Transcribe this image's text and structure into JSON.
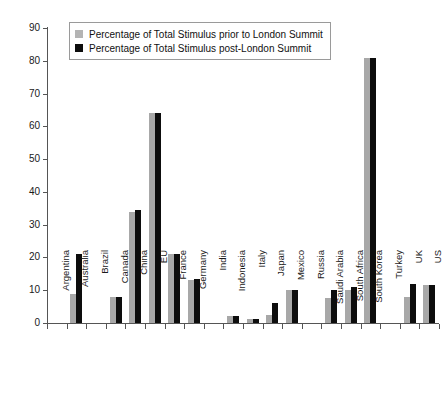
{
  "chart_data": {
    "type": "bar",
    "title": "",
    "subtitle": "",
    "xlabel": "",
    "ylabel": "",
    "ylim": [
      0,
      90
    ],
    "ytick_step": 10,
    "yticks": [
      "0",
      "10",
      "20",
      "30",
      "40",
      "50",
      "60",
      "70",
      "80",
      "90"
    ],
    "grid": false,
    "legend_position": "top-left-inside",
    "categories": [
      "Argentina",
      "Australia",
      "Brazil",
      "Canada",
      "China",
      "EU",
      "France",
      "Germany",
      "India",
      "Indonesia",
      "Italy",
      "Japan",
      "Mexico",
      "Russia",
      "Saudi Arabia",
      "South Africa",
      "South Korea",
      "Turkey",
      "UK",
      "US"
    ],
    "series": [
      {
        "name": "Percentage of Total Stimulus prior to London Summit",
        "color": "#a8a8a8",
        "values": [
          0,
          9,
          0,
          8,
          34,
          64,
          21,
          13,
          0,
          2,
          1.2,
          2.5,
          10,
          0,
          7.5,
          10,
          81,
          0,
          8,
          11.5
        ]
      },
      {
        "name": "Percentage of Total Stimulus post-London Summit",
        "color": "#0d0d0d",
        "values": [
          0,
          21,
          0,
          8,
          34.5,
          64,
          21,
          13.5,
          0,
          2,
          1.2,
          6,
          10,
          0,
          10,
          11,
          81,
          0,
          12,
          11.5
        ]
      }
    ]
  },
  "legend": {
    "items": [
      {
        "label": "Percentage of Total Stimulus prior to London Summit",
        "swatch": "prior"
      },
      {
        "label": "Percentage of Total Stimulus post-London Summit",
        "swatch": "post"
      }
    ]
  },
  "colors": {
    "prior": "#a8a8a8",
    "post": "#0d0d0d",
    "axis": "#555555",
    "text": "#1a1a1a",
    "background": "#ffffff"
  }
}
